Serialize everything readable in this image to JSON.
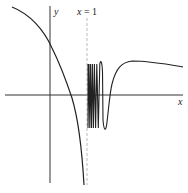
{
  "figure": {
    "labels": {
      "y_axis": "y",
      "x_axis": "x",
      "asymptote_var": "x",
      "asymptote_eq": " = 1"
    },
    "colors": {
      "curve": "#222222",
      "axes": "#333333",
      "asymptote": "#aaaaaa",
      "background": "#ffffff"
    }
  }
}
